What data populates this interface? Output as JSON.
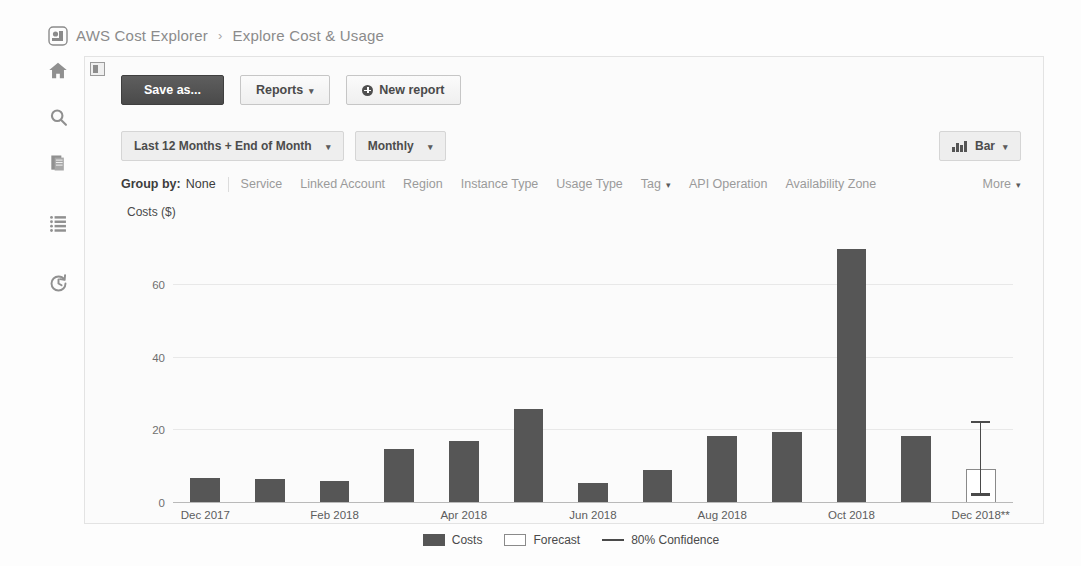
{
  "breadcrumb": {
    "logo_icon": "aws-cost-explorer-logo-icon",
    "root": "AWS Cost Explorer",
    "separator": "›",
    "current": "Explore Cost & Usage"
  },
  "rail": {
    "items": [
      {
        "name": "home-icon",
        "label": "Home"
      },
      {
        "name": "search-icon",
        "label": "Search"
      },
      {
        "name": "documents-icon",
        "label": "Documents"
      },
      {
        "name": "list-icon",
        "label": "Reports list"
      },
      {
        "name": "history-icon",
        "label": "History"
      }
    ]
  },
  "panel": {
    "toggle_icon": "panel-toggle-icon"
  },
  "toolbar": {
    "save_as_label": "Save as...",
    "reports_label": "Reports",
    "new_report_label": "New report",
    "caret": "▾",
    "new_report_icon": "plus-circle-icon"
  },
  "controls": {
    "date_range": "Last 12 Months + End of Month",
    "granularity": "Monthly",
    "chart_type": "Bar",
    "chart_type_icon": "bar-chart-icon",
    "caret": "▾"
  },
  "group_by": {
    "label": "Group by:",
    "active": "None",
    "items": [
      {
        "label": "Service",
        "has_caret": false
      },
      {
        "label": "Linked Account",
        "has_caret": false
      },
      {
        "label": "Region",
        "has_caret": false
      },
      {
        "label": "Instance Type",
        "has_caret": false
      },
      {
        "label": "Usage Type",
        "has_caret": false
      },
      {
        "label": "Tag",
        "has_caret": true
      },
      {
        "label": "API Operation",
        "has_caret": false
      },
      {
        "label": "Availability Zone",
        "has_caret": false
      }
    ],
    "more_label": "More",
    "caret": "▾"
  },
  "chart_data": {
    "type": "bar",
    "title": "",
    "xlabel": "",
    "ylabel": "Costs ($)",
    "ylim": [
      0,
      75
    ],
    "yticks": [
      0,
      20,
      40,
      60
    ],
    "grid": true,
    "legend_position": "bottom",
    "categories": [
      "Dec 2017",
      "Jan 2018",
      "Feb 2018",
      "Mar 2018",
      "Apr 2018",
      "May 2018",
      "Jun 2018",
      "Jul 2018",
      "Aug 2018",
      "Sep 2018",
      "Oct 2018",
      "Nov 2018",
      "Dec 2018**"
    ],
    "tick_labels": [
      "Dec 2017",
      "",
      "Feb 2018",
      "",
      "Apr 2018",
      "",
      "Jun 2018",
      "",
      "Aug 2018",
      "",
      "Oct 2018",
      "",
      "Dec 2018**"
    ],
    "series": [
      {
        "name": "Costs",
        "color": "#565656",
        "values": [
          7,
          6.5,
          6,
          15,
          17,
          26,
          5.5,
          9,
          18.5,
          19.5,
          70,
          18.5,
          null
        ]
      },
      {
        "name": "Forecast",
        "color": "#ffffff",
        "values": [
          null,
          null,
          null,
          null,
          null,
          null,
          null,
          null,
          null,
          null,
          null,
          null,
          9.5
        ]
      }
    ],
    "confidence": {
      "name": "80% Confidence",
      "index": 12,
      "low": 2,
      "high": 22
    },
    "legend": [
      {
        "label": "Costs",
        "swatch": "solid"
      },
      {
        "label": "Forecast",
        "swatch": "open"
      },
      {
        "label": "80% Confidence",
        "swatch": "line"
      }
    ]
  }
}
